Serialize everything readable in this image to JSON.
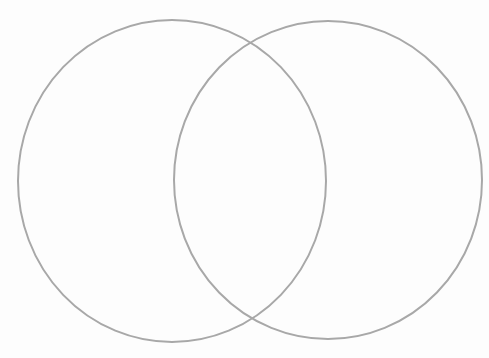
{
  "diagram": {
    "type": "venn",
    "sets": 2,
    "labels": [],
    "background_color": "#fdfdfd",
    "stroke_color": "#a8a8a8",
    "stroke_width": 2,
    "circles": [
      {
        "name": "left-set",
        "cx": 172,
        "cy": 181,
        "rx": 154,
        "ry": 161
      },
      {
        "name": "right-set",
        "cx": 328,
        "cy": 180,
        "rx": 154,
        "ry": 159
      }
    ]
  }
}
